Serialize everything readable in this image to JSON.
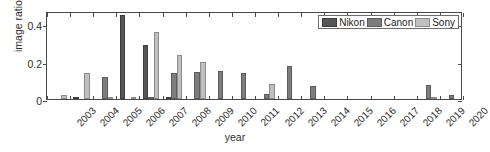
{
  "chart_data": {
    "type": "bar",
    "title": "",
    "xlabel": "year",
    "ylabel": "image ratio",
    "ylim": [
      0,
      0.47
    ],
    "yticks": [
      0,
      0.2,
      0.4
    ],
    "ytick_labels": [
      "0",
      "0.2",
      "0.4"
    ],
    "grid": false,
    "legend_position": "upper right",
    "categories": [
      "2003",
      "2004",
      "2005",
      "2006",
      "2007",
      "2008",
      "2009",
      "2010",
      "2011",
      "2012",
      "2013",
      "2014",
      "2015",
      "2016",
      "2017",
      "2018",
      "2019",
      "2020"
    ],
    "series": [
      {
        "name": "Nikon",
        "color": "#565656",
        "values": [
          0.0,
          0.005,
          0.0,
          0.45,
          0.29,
          0.004,
          0.0,
          0.0,
          0.0,
          0.0,
          0.0,
          0.0,
          0.0,
          0.0,
          0.0,
          0.0,
          0.0,
          0.0
        ]
      },
      {
        "name": "Canon",
        "color": "#7d7d7d",
        "values": [
          0.0,
          0.0,
          0.12,
          0.0,
          0.006,
          0.14,
          0.145,
          0.148,
          0.138,
          0.027,
          0.175,
          0.07,
          0.0,
          0.0,
          0.0,
          0.0,
          0.075,
          0.02
        ]
      },
      {
        "name": "Sony",
        "color": "#bfbfbf",
        "values": [
          0.022,
          0.138,
          0.008,
          0.008,
          0.36,
          0.237,
          0.198,
          0.0,
          0.0,
          0.082,
          0.0,
          0.0,
          0.0,
          0.0,
          0.0,
          0.0,
          0.004,
          0.0
        ]
      }
    ]
  },
  "legend": {
    "items": [
      {
        "label": "Nikon"
      },
      {
        "label": "Canon"
      },
      {
        "label": "Sony"
      }
    ]
  }
}
